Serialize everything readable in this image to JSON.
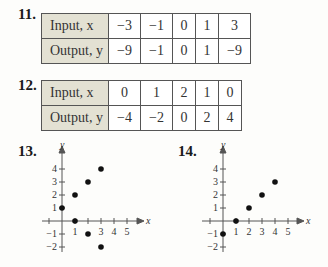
{
  "problems": [
    {
      "number": "11.",
      "table": {
        "rows": [
          {
            "label": "Input, x",
            "var": "x",
            "values": [
              "−3",
              "−1",
              "0",
              "1",
              "3"
            ]
          },
          {
            "label": "Output, y",
            "var": "y",
            "values": [
              "−9",
              "−1",
              "0",
              "1",
              "−9"
            ]
          }
        ]
      }
    },
    {
      "number": "12.",
      "table": {
        "rows": [
          {
            "label": "Input, x",
            "var": "x",
            "values": [
              "0",
              "1",
              "2",
              "1",
              "0"
            ]
          },
          {
            "label": "Output, y",
            "var": "y",
            "values": [
              "−4",
              "−2",
              "0",
              "2",
              "4"
            ]
          }
        ]
      }
    },
    {
      "number": "13.",
      "graph": {
        "x_label": "x",
        "y_label": "y",
        "x_ticks": [
          "1",
          "3",
          "4",
          "5"
        ],
        "y_ticks": [
          "4",
          "3",
          "2",
          "1",
          "−1",
          "−2"
        ],
        "points": [
          [
            0,
            1
          ],
          [
            1,
            2
          ],
          [
            2,
            3
          ],
          [
            3,
            4
          ],
          [
            1,
            0
          ],
          [
            2,
            -1
          ],
          [
            3,
            -2
          ]
        ]
      }
    },
    {
      "number": "14.",
      "graph": {
        "x_label": "x",
        "y_label": "y",
        "x_ticks": [
          "1",
          "2",
          "3",
          "4",
          "5"
        ],
        "y_ticks": [
          "4",
          "3",
          "2",
          "1",
          "−1",
          "−2"
        ],
        "points": [
          [
            0,
            -1
          ],
          [
            1,
            0
          ],
          [
            2,
            1
          ],
          [
            3,
            2
          ],
          [
            4,
            3
          ]
        ]
      }
    }
  ],
  "colors": {
    "header_cell": "#e3e1d3",
    "border": "#555555",
    "ink": "#222222"
  }
}
